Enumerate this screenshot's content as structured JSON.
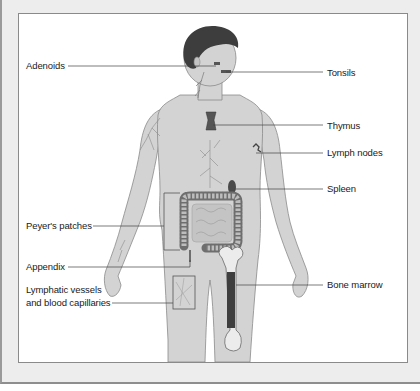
{
  "figure": {
    "colors": {
      "frame_bg": "#ededed",
      "panel_bg": "#ffffff",
      "skin": "#d3d3d3",
      "skin_outline": "#8a8a8a",
      "hair": "#3d3d3d",
      "organ_dark": "#4a4a4a",
      "leader_line": "#444444",
      "text": "#1a1a1a"
    },
    "labels_left": [
      {
        "text": "Adenoids",
        "target": "adenoids"
      },
      {
        "text": "Peyer's patches",
        "target": "peyers-patches"
      },
      {
        "text": "Appendix",
        "target": "appendix"
      },
      {
        "text": "Lymphatic vessels",
        "text2": "and blood capillaries",
        "target": "lymphatic-vessels"
      }
    ],
    "labels_right": [
      {
        "text": "Tonsils",
        "target": "tonsils"
      },
      {
        "text": "Thymus",
        "target": "thymus"
      },
      {
        "text": "Lymph nodes",
        "target": "lymph-nodes"
      },
      {
        "text": "Spleen",
        "target": "spleen"
      },
      {
        "text": "Bone marrow",
        "target": "bone-marrow"
      }
    ]
  }
}
